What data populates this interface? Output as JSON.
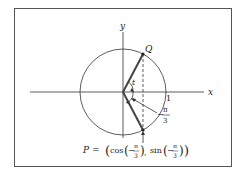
{
  "diagram": {
    "axis_x_label": "x",
    "axis_y_label": "y",
    "point_q_label": "Q",
    "angle_label": "t",
    "tick_one_label": "1",
    "neg_angle_label": {
      "minus": "−",
      "numerator": "π",
      "denominator": "3"
    },
    "point_p_label": {
      "prefix": "P = ",
      "cos_text": "cos",
      "sin_text": "sin",
      "minus": "−",
      "pi": "π",
      "three": "3",
      "comma": ","
    },
    "colors": {
      "frame": "#555555",
      "lines": "#333333",
      "radius": "#444444"
    }
  }
}
